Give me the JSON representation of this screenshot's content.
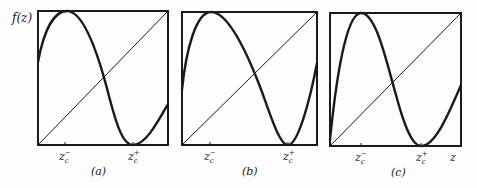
{
  "figure": {
    "y_axis_label": "f(z)",
    "x_axis_label": "z",
    "panels": [
      {
        "id": "a",
        "caption": "(a)",
        "tick_minus": {
          "base": "z",
          "sub": "c",
          "sup": "−"
        },
        "tick_plus": {
          "base": "z",
          "sub": "c",
          "sup": "+"
        }
      },
      {
        "id": "b",
        "caption": "(b)",
        "tick_minus": {
          "base": "z",
          "sub": "c",
          "sup": "−"
        },
        "tick_plus": {
          "base": "z",
          "sub": "c",
          "sup": "+"
        }
      },
      {
        "id": "c",
        "caption": "(c)",
        "tick_minus": {
          "base": "z",
          "sub": "c",
          "sup": "−"
        },
        "tick_plus": {
          "base": "z",
          "sub": "c",
          "sup": "+"
        }
      }
    ]
  },
  "colors": {
    "ink": "#1a1a1a",
    "background": "#fdfdfd"
  }
}
